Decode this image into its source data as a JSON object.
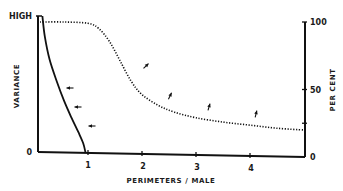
{
  "chart_data": {
    "type": "line",
    "title": "",
    "xlabel": "PERIMETERS / MALE",
    "ylabel_left": "VARIANCE",
    "ylabel_right": "PER CENT",
    "xlim": [
      0,
      5
    ],
    "ylim_right": [
      0,
      100
    ],
    "x_ticks": [
      "1",
      "2",
      "3",
      "4"
    ],
    "left_ticks": [
      "HIGH",
      "0"
    ],
    "right_ticks": [
      "100",
      "50",
      "0"
    ],
    "grid": false,
    "legend": "none",
    "series": [
      {
        "name": "variance",
        "style": "solid",
        "axis": "left",
        "x": [
          0.05,
          0.1,
          0.2,
          0.35,
          0.5,
          0.65,
          0.8,
          0.9,
          0.95
        ],
        "y_relative": [
          1.0,
          0.85,
          0.68,
          0.52,
          0.38,
          0.26,
          0.15,
          0.07,
          0.0
        ]
      },
      {
        "name": "per cent",
        "style": "dotted",
        "axis": "right",
        "x": [
          0,
          0.5,
          1.0,
          1.2,
          1.4,
          1.6,
          1.8,
          2.0,
          2.3,
          2.6,
          3.0,
          3.5,
          4.0,
          4.5,
          5.0
        ],
        "y": [
          100,
          100,
          99,
          95,
          85,
          70,
          55,
          45,
          37,
          32,
          28,
          25,
          23,
          21,
          20
        ]
      }
    ],
    "annotations": [
      {
        "type": "arrow",
        "series": "variance",
        "near_x": 0.55,
        "direction": "toward-curve"
      },
      {
        "type": "arrow",
        "series": "variance",
        "near_x": 0.7,
        "direction": "toward-curve"
      },
      {
        "type": "arrow",
        "series": "variance",
        "near_x": 0.85,
        "direction": "toward-curve"
      },
      {
        "type": "arrow",
        "series": "per cent",
        "near_x": 1.9,
        "direction": "up"
      },
      {
        "type": "arrow",
        "series": "per cent",
        "near_x": 2.6,
        "direction": "up"
      },
      {
        "type": "arrow",
        "series": "per cent",
        "near_x": 3.3,
        "direction": "up"
      },
      {
        "type": "arrow",
        "series": "per cent",
        "near_x": 4.3,
        "direction": "up"
      }
    ]
  }
}
